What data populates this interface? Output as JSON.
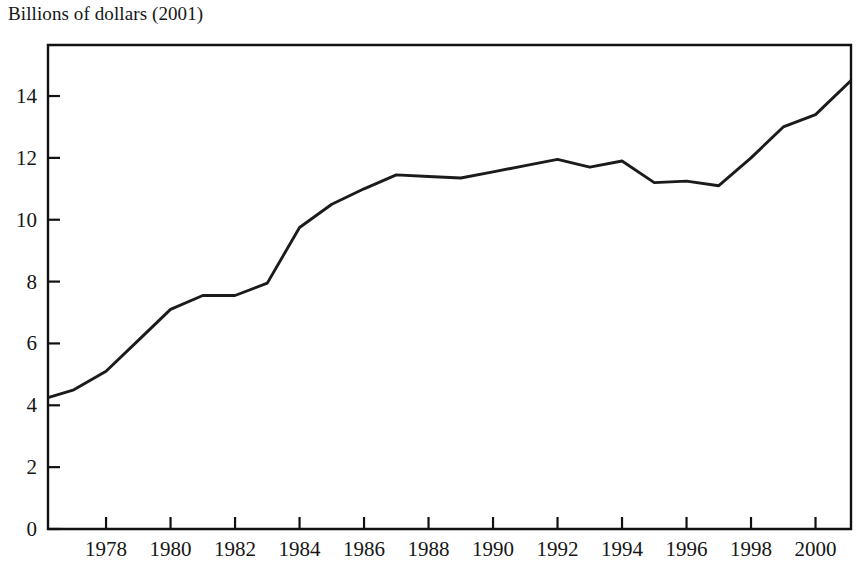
{
  "chart_data": {
    "type": "line",
    "title": "Billions of dollars (2001)",
    "xlabel": "",
    "ylabel": "Billions of dollars (2001)",
    "xlim": [
      1976.2,
      2001.1
    ],
    "ylim": [
      0,
      15.65
    ],
    "grid": false,
    "legend": "none",
    "y_ticks": [
      0,
      2,
      4,
      6,
      8,
      10,
      12,
      14
    ],
    "y_tick_labels": [
      "0",
      "2",
      "4",
      "6",
      "8",
      "10",
      "12",
      "14"
    ],
    "x_ticks": [
      1978,
      1980,
      1982,
      1984,
      1986,
      1988,
      1990,
      1992,
      1994,
      1996,
      1998,
      2000
    ],
    "x_tick_labels": [
      "1978",
      "1980",
      "1982",
      "1984",
      "1986",
      "1988",
      "1990",
      "1992",
      "1994",
      "1996",
      "1998",
      "2000"
    ],
    "x": [
      1976.2,
      1977,
      1978,
      1979,
      1980,
      1981,
      1982,
      1983,
      1984,
      1985,
      1986,
      1987,
      1988,
      1989,
      1990,
      1991,
      1992,
      1993,
      1994,
      1995,
      1996,
      1997,
      1998,
      1999,
      2000,
      2001.1
    ],
    "values": [
      4.25,
      4.5,
      5.1,
      6.1,
      7.1,
      7.55,
      7.55,
      7.95,
      9.75,
      10.5,
      11.0,
      11.45,
      11.4,
      11.35,
      11.55,
      11.75,
      11.95,
      11.7,
      11.9,
      11.2,
      11.25,
      11.1,
      12.0,
      13.0,
      13.4,
      14.5
    ],
    "line_color": "#1b1b1b",
    "series": [
      {
        "name": "Billions of dollars (2001)",
        "values": [
          4.25,
          4.5,
          5.1,
          6.1,
          7.1,
          7.55,
          7.55,
          7.95,
          9.75,
          10.5,
          11.0,
          11.45,
          11.4,
          11.35,
          11.55,
          11.75,
          11.95,
          11.7,
          11.9,
          11.2,
          11.25,
          11.1,
          12.0,
          13.0,
          13.4,
          14.5
        ]
      }
    ]
  },
  "plot_geometry": {
    "left": 48,
    "right": 851,
    "top": 45,
    "bottom": 529,
    "tick_length": 12
  }
}
